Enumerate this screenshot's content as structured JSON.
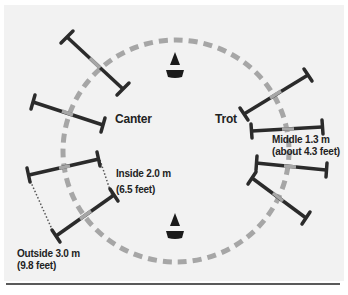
{
  "labels": {
    "canter": "Canter",
    "trot": "Trot",
    "middle_line1": "Middle 1.3 m",
    "middle_line2": "(about 4.3 feet)",
    "inside_line1": "Inside 2.0 m",
    "inside_line2": "(6.5 feet)",
    "outside_line1": "Outside 3.0 m",
    "outside_line2": "(9.8 feet)"
  },
  "icons": {
    "top_marker": "cone-icon",
    "bottom_marker": "cone-icon"
  },
  "colors": {
    "panel_bg": "#f2f2f2",
    "circle_dash": "#a6a6a6",
    "pole": "#2b2b2b",
    "pole_center": "#a6a6a6",
    "text": "#222222",
    "rule": "#5a5a5a"
  }
}
